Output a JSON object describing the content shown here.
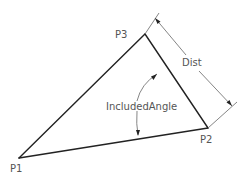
{
  "diagram": {
    "type": "geometry",
    "points": [
      {
        "id": "P1",
        "label": "P1",
        "x": 19,
        "y": 158
      },
      {
        "id": "P2",
        "label": "P2",
        "x": 208,
        "y": 128
      },
      {
        "id": "P3",
        "label": "P3",
        "x": 145,
        "y": 34
      }
    ],
    "edges": [
      {
        "from": "P1",
        "to": "P3"
      },
      {
        "from": "P3",
        "to": "P2"
      },
      {
        "from": "P1",
        "to": "P2"
      }
    ],
    "dimensions": {
      "distance_label": "Dist",
      "angle_label": "IncludedAngle"
    },
    "colors": {
      "edge": "#222222",
      "dimension": "#777777",
      "text": "#555555",
      "background": "#ffffff"
    }
  }
}
